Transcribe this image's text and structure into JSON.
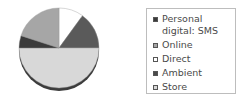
{
  "chart_data": {
    "type": "pie",
    "title": "",
    "start_angle_deg": 0,
    "direction": "clockwise",
    "slices": [
      {
        "label": "Direct",
        "value": 10,
        "color": "#ffffff"
      },
      {
        "label": "Personal digital: SMS",
        "value": 15,
        "color": "#5a5a5a"
      },
      {
        "label": "Store",
        "value": 50,
        "color": "#d8d8d8"
      },
      {
        "label": "Ambient",
        "value": 5,
        "color": "#3a3a3a"
      },
      {
        "label": "Online",
        "value": 20,
        "color": "#a6a6a6"
      }
    ],
    "legend_position": "right"
  },
  "legend": {
    "items": [
      {
        "label": "Personal digital: SMS",
        "color": "#3a3a3a"
      },
      {
        "label": "Online",
        "color": "#a6a6a6"
      },
      {
        "label": "Direct",
        "color": "#ffffff"
      },
      {
        "label": "Ambient",
        "color": "#4a4a4a"
      },
      {
        "label": "Store",
        "color": "#d8d8d8"
      }
    ]
  }
}
